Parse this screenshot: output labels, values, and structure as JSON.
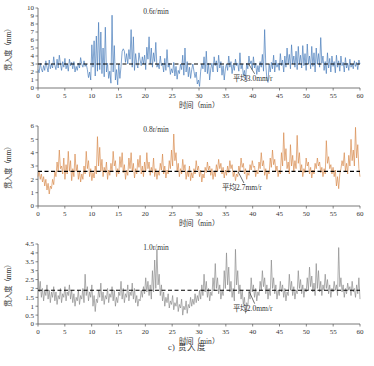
{
  "figure": {
    "caption": "c) 贯入度",
    "panels": [
      {
        "id": "panel-1",
        "series_label": "0.6r/min",
        "mean_label": "平均3.0mm/r",
        "mean_value": 3.0,
        "color": "#4a7ebb",
        "xlabel": "时间（min）",
        "ylabel": "贯入度（mm）",
        "xticks": [
          "0",
          "5",
          "10",
          "15",
          "20",
          "25",
          "30",
          "35",
          "40",
          "45",
          "50",
          "55",
          "60"
        ],
        "yticks": [
          "0",
          "1",
          "2",
          "3",
          "4",
          "5",
          "6",
          "7",
          "8",
          "9",
          "10"
        ],
        "xlim": [
          0,
          60
        ],
        "ylim": [
          0,
          10
        ]
      },
      {
        "id": "panel-2",
        "series_label": "0.8r/min",
        "mean_label": "平均2.7mm/r",
        "mean_value": 2.6,
        "color": "#d98c50",
        "xlabel": "时间（min）",
        "ylabel": "贯入度（mm）",
        "xticks": [
          "0",
          "5",
          "10",
          "15",
          "20",
          "25",
          "30",
          "35",
          "40",
          "45",
          "50",
          "55",
          "60"
        ],
        "yticks": [
          "0",
          "1",
          "2",
          "3",
          "4",
          "5",
          "6"
        ],
        "xlim": [
          0,
          60
        ],
        "ylim": [
          0,
          6
        ]
      },
      {
        "id": "panel-3",
        "series_label": "1.0r/min",
        "mean_label": "平均2.0mm/r",
        "mean_value": 1.9,
        "color": "#8c8c8c",
        "xlabel": "时间（min）",
        "ylabel": "贯入度（mm）",
        "xticks": [
          "0",
          "5",
          "10",
          "15",
          "20",
          "25",
          "30",
          "35",
          "40",
          "45",
          "50",
          "55",
          "60"
        ],
        "yticks": [
          "0",
          "0.5",
          "1",
          "1.5",
          "2",
          "2.5",
          "3",
          "3.5",
          "4",
          "4.5"
        ],
        "xlim": [
          0,
          60
        ],
        "ylim": [
          0,
          4.5
        ]
      }
    ]
  },
  "chart_data": [
    {
      "type": "line",
      "title": "0.6r/min",
      "xlabel": "时间（min）",
      "ylabel": "贯入度（mm）",
      "xlim": [
        0,
        60
      ],
      "ylim": [
        0,
        10
      ],
      "grid": false,
      "legend": "none",
      "annotations": [
        {
          "text": "平均3.0mm/r",
          "x": 40,
          "y": 0.9
        }
      ],
      "mean_line": {
        "value": 3.0,
        "style": "dashed",
        "color": "#000000"
      },
      "color": "#4a7ebb",
      "x_step": 0.25,
      "values": [
        2.3,
        1.9,
        3.1,
        2.4,
        2.0,
        2.8,
        2.2,
        3.4,
        2.6,
        2.0,
        3.5,
        2.4,
        3.0,
        2.5,
        3.9,
        2.8,
        2.3,
        3.6,
        2.5,
        4.1,
        3.0,
        2.2,
        3.3,
        2.6,
        3.7,
        2.4,
        3.0,
        2.1,
        3.6,
        2.8,
        3.2,
        2.4,
        3.3,
        2.0,
        2.7,
        2.2,
        3.1,
        2.5,
        3.8,
        3.0,
        2.6,
        3.4,
        2.7,
        3.0,
        2.3,
        1.3,
        2.0,
        1.0,
        5.4,
        2.6,
        5.9,
        1.5,
        6.5,
        2.1,
        8.2,
        2.3,
        7.0,
        1.8,
        5.0,
        1.4,
        7.6,
        2.0,
        3.1,
        1.2,
        2.1,
        0.6,
        9.1,
        2.0,
        5.3,
        1.0,
        2.3,
        0.4,
        3.0,
        1.2,
        2.7,
        4.6,
        4.9,
        4.6,
        3.2,
        4.3,
        3.0,
        4.8,
        3.6,
        7.3,
        2.6,
        6.4,
        2.2,
        4.3,
        3.0,
        2.5,
        4.4,
        3.5,
        2.8,
        3.9,
        3.0,
        4.1,
        2.3,
        5.1,
        3.6,
        6.4,
        3.0,
        5.0,
        2.6,
        4.4,
        3.3,
        5.7,
        2.6,
        3.0,
        2.4,
        4.0,
        2.8,
        3.1,
        2.0,
        3.7,
        2.2,
        4.8,
        2.6,
        3.1,
        1.7,
        2.4,
        1.9,
        3.2,
        1.5,
        2.7,
        1.1,
        2.2,
        1.8,
        3.0,
        2.3,
        4.1,
        1.6,
        5.0,
        2.0,
        3.3,
        1.4,
        2.6,
        1.2,
        2.3,
        3.0,
        2.1,
        1.3,
        2.0,
        0.5,
        1.0,
        0.2,
        2.1,
        3.0,
        2.4,
        3.9,
        2.0,
        4.6,
        1.8,
        3.1,
        1.0,
        2.4,
        3.1,
        2.0,
        3.9,
        2.8,
        3.4,
        2.0,
        4.1,
        2.5,
        3.3,
        1.6,
        2.8,
        1.0,
        2.4,
        3.0,
        2.2,
        4.0,
        2.6,
        3.3,
        1.8,
        2.9,
        2.2,
        3.6,
        2.8,
        3.1,
        2.1,
        4.4,
        2.4,
        3.0,
        1.6,
        2.2,
        1.1,
        3.1,
        2.4,
        4.0,
        3.0,
        3.4,
        2.3,
        3.9,
        2.5,
        3.1,
        1.7,
        2.8,
        2.0,
        3.3,
        2.6,
        4.2,
        2.1,
        7.3,
        3.0,
        1.1,
        0.7,
        3.0,
        2.0,
        3.2,
        2.4,
        4.1,
        2.0,
        3.5,
        2.6,
        3.1,
        2.2,
        4.3,
        2.8,
        3.5,
        2.0,
        4.0,
        2.6,
        5.0,
        3.0,
        4.2,
        2.4,
        5.4,
        3.0,
        4.0,
        2.6,
        4.6,
        2.3,
        5.2,
        3.0,
        4.1,
        2.5,
        5.3,
        2.8,
        4.3,
        2.2,
        5.5,
        3.0,
        4.0,
        2.4,
        5.2,
        2.7,
        4.4,
        2.0,
        5.0,
        3.0,
        4.3,
        2.6,
        6.3,
        3.1,
        4.0,
        2.2,
        3.3,
        1.8,
        4.4,
        2.5,
        3.7,
        2.0,
        4.0,
        2.7,
        3.3,
        1.9,
        4.1,
        2.6,
        3.4,
        2.1,
        4.0,
        2.8,
        3.2,
        2.0,
        3.8,
        2.5,
        3.1,
        2.2,
        3.6,
        2.6,
        3.0,
        2.4,
        3.4,
        2.7,
        3.2,
        2.3,
        3.5,
        3.0
      ]
    },
    {
      "type": "line",
      "title": "0.8r/min",
      "xlabel": "时间（min）",
      "ylabel": "贯入度（mm）",
      "xlim": [
        0,
        60
      ],
      "ylim": [
        0,
        6
      ],
      "grid": false,
      "legend": "none",
      "annotations": [
        {
          "text": "平均2.7mm/r",
          "x": 38,
          "y": 1.2
        }
      ],
      "mean_line": {
        "value": 2.6,
        "style": "dashed",
        "color": "#000000"
      },
      "color": "#d98c50",
      "x_step": 0.25,
      "values": [
        2.2,
        2.6,
        2.0,
        2.4,
        1.8,
        2.2,
        1.5,
        2.0,
        1.2,
        1.7,
        0.9,
        1.5,
        1.3,
        2.0,
        1.6,
        2.6,
        2.2,
        3.3,
        2.6,
        4.2,
        2.8,
        3.0,
        2.4,
        3.6,
        2.0,
        3.1,
        2.4,
        4.1,
        2.6,
        3.4,
        1.9,
        2.8,
        2.2,
        3.9,
        2.6,
        3.1,
        2.0,
        2.6,
        1.8,
        2.4,
        2.0,
        3.0,
        2.4,
        4.1,
        2.8,
        3.4,
        2.2,
        2.8,
        1.9,
        2.5,
        2.1,
        3.0,
        2.4,
        5.2,
        3.0,
        4.4,
        2.6,
        3.5,
        2.2,
        2.9,
        2.5,
        3.3,
        2.0,
        2.7,
        2.3,
        3.2,
        2.6,
        4.1,
        3.0,
        3.4,
        2.2,
        2.8,
        2.4,
        3.7,
        2.9,
        4.0,
        2.5,
        3.1,
        2.0,
        2.7,
        2.3,
        3.6,
        2.8,
        4.0,
        2.6,
        3.2,
        2.1,
        2.8,
        2.4,
        3.5,
        2.9,
        3.8,
        2.4,
        3.0,
        2.2,
        3.3,
        2.6,
        4.0,
        2.8,
        3.3,
        2.3,
        2.9,
        2.5,
        3.6,
        2.2,
        2.8,
        2.0,
        2.6,
        2.3,
        3.2,
        2.7,
        3.9,
        2.4,
        3.0,
        2.1,
        2.7,
        2.4,
        3.4,
        2.8,
        4.2,
        3.0,
        5.4,
        3.4,
        4.0,
        2.6,
        3.2,
        2.2,
        2.8,
        2.4,
        3.5,
        2.7,
        3.1,
        2.0,
        2.6,
        2.2,
        3.0,
        1.9,
        2.5,
        2.1,
        2.8,
        2.4,
        3.4,
        2.7,
        3.0,
        2.2,
        2.7,
        1.8,
        2.4,
        2.1,
        2.9,
        2.5,
        3.3,
        2.7,
        3.0,
        2.3,
        2.8,
        2.0,
        2.6,
        2.2,
        3.1,
        2.6,
        3.5,
        2.8,
        3.2,
        2.4,
        2.9,
        2.1,
        2.7,
        2.3,
        3.0,
        2.5,
        3.4,
        2.8,
        3.1,
        2.2,
        2.6,
        1.9,
        2.4,
        2.2,
        3.0,
        2.6,
        3.6,
        2.9,
        3.2,
        2.4,
        2.8,
        2.0,
        2.5,
        2.3,
        3.1,
        2.7,
        3.4,
        2.9,
        3.0,
        2.2,
        2.7,
        2.4,
        3.3,
        2.8,
        4.0,
        3.0,
        3.4,
        2.3,
        2.8,
        2.0,
        2.6,
        2.4,
        3.6,
        2.9,
        4.2,
        3.1,
        3.5,
        2.6,
        3.0,
        2.2,
        2.7,
        2.4,
        4.0,
        3.0,
        5.5,
        3.4,
        4.3,
        2.8,
        3.3,
        2.4,
        4.6,
        3.0,
        3.8,
        2.6,
        3.4,
        2.8,
        5.3,
        3.2,
        4.0,
        2.6,
        3.1,
        2.2,
        2.8,
        2.5,
        3.6,
        3.0,
        3.3,
        2.4,
        2.9,
        2.1,
        2.7,
        2.4,
        3.2,
        2.8,
        3.6,
        3.0,
        3.3,
        2.5,
        2.9,
        2.2,
        2.8,
        2.4,
        4.9,
        3.2,
        3.7,
        2.8,
        3.1,
        2.4,
        2.9,
        2.2,
        2.7,
        1.5,
        2.2,
        1.3,
        2.4,
        2.8,
        3.4,
        3.0,
        4.0,
        2.6,
        3.2,
        2.4,
        3.8,
        3.0,
        5.0,
        3.4,
        4.2,
        3.0,
        5.9,
        3.6,
        4.6,
        2.8,
        2.2
      ]
    },
    {
      "type": "line",
      "title": "1.0r/min",
      "xlabel": "时间（min）",
      "ylabel": "贯入度（mm）",
      "xlim": [
        0,
        60
      ],
      "ylim": [
        0,
        4.5
      ],
      "grid": false,
      "legend": "none",
      "annotations": [
        {
          "text": "平均2.0mm/r",
          "x": 40,
          "y": 0.75
        }
      ],
      "mean_line": {
        "value": 1.9,
        "style": "dashed",
        "color": "#000000"
      },
      "color": "#8c8c8c",
      "x_step": 0.25,
      "values": [
        2.9,
        1.8,
        2.4,
        1.5,
        2.0,
        1.3,
        1.9,
        1.6,
        2.2,
        1.4,
        1.9,
        1.2,
        1.8,
        1.5,
        2.1,
        1.3,
        1.8,
        1.1,
        1.6,
        1.4,
        2.0,
        1.2,
        1.7,
        1.5,
        2.1,
        1.3,
        1.8,
        1.6,
        2.2,
        1.4,
        1.9,
        1.2,
        1.7,
        1.0,
        1.5,
        1.3,
        1.9,
        1.1,
        1.6,
        1.4,
        2.0,
        1.2,
        2.8,
        1.6,
        2.1,
        1.3,
        1.8,
        1.5,
        2.2,
        1.0,
        1.6,
        0.7,
        1.4,
        1.2,
        1.9,
        1.5,
        2.3,
        1.3,
        1.8,
        1.1,
        1.6,
        1.4,
        2.0,
        1.2,
        1.7,
        1.5,
        2.1,
        1.3,
        1.9,
        1.0,
        1.5,
        1.2,
        1.8,
        1.6,
        2.4,
        1.4,
        2.0,
        1.2,
        1.7,
        1.5,
        2.2,
        1.3,
        1.8,
        1.6,
        2.3,
        1.4,
        2.0,
        1.2,
        1.6,
        1.0,
        1.4,
        1.3,
        1.9,
        1.5,
        2.1,
        1.7,
        2.6,
        1.8,
        2.4,
        1.6,
        2.2,
        1.4,
        3.0,
        1.8,
        3.6,
        2.0,
        4.2,
        2.2,
        2.8,
        1.6,
        2.2,
        1.3,
        1.8,
        1.0,
        1.5,
        1.2,
        1.7,
        0.9,
        1.3,
        1.1,
        1.6,
        0.8,
        1.2,
        1.0,
        1.5,
        0.7,
        1.1,
        0.9,
        1.4,
        0.5,
        1.0,
        0.8,
        1.3,
        0.6,
        1.1,
        0.9,
        1.5,
        1.0,
        1.4,
        1.1,
        1.7,
        1.2,
        1.6,
        1.3,
        1.9,
        1.4,
        2.2,
        1.6,
        2.8,
        1.8,
        2.4,
        1.5,
        2.0,
        1.3,
        1.8,
        1.6,
        2.6,
        1.9,
        3.4,
        2.0,
        2.6,
        1.7,
        2.2,
        1.4,
        1.9,
        1.6,
        3.0,
        2.0,
        4.0,
        2.2,
        3.2,
        1.8,
        2.4,
        1.5,
        2.0,
        1.3,
        4.2,
        2.2,
        3.0,
        1.7,
        2.2,
        1.4,
        1.9,
        1.1,
        1.5,
        0.6,
        1.2,
        1.0,
        1.8,
        1.4,
        2.6,
        1.8,
        2.2,
        1.5,
        2.0,
        1.3,
        1.8,
        1.6,
        2.4,
        1.9,
        3.0,
        2.1,
        2.6,
        1.7,
        2.2,
        1.4,
        2.0,
        1.6,
        3.6,
        2.0,
        2.6,
        1.7,
        2.2,
        1.4,
        1.9,
        1.6,
        2.4,
        1.8,
        2.2,
        1.5,
        2.0,
        1.3,
        1.8,
        1.6,
        2.8,
        1.9,
        2.4,
        1.6,
        2.1,
        1.4,
        1.9,
        1.7,
        3.0,
        2.0,
        2.5,
        1.7,
        2.2,
        1.5,
        2.0,
        1.8,
        2.6,
        1.9,
        3.2,
        2.1,
        2.7,
        1.8,
        2.3,
        1.6,
        3.4,
        2.0,
        3.0,
        1.8,
        2.4,
        1.6,
        2.2,
        1.9,
        2.8,
        2.0,
        2.5,
        1.7,
        2.2,
        1.5,
        2.0,
        1.8,
        2.4,
        1.9,
        2.2,
        1.6,
        4.3,
        2.1,
        2.6,
        1.8,
        2.2,
        1.5,
        2.0,
        1.7,
        2.3,
        1.9,
        2.1,
        1.6,
        2.4,
        1.8,
        2.0,
        1.5,
        2.2,
        1.7,
        2.6,
        1.4
      ]
    }
  ]
}
